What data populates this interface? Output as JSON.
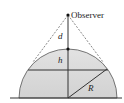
{
  "diagram": {
    "labels": {
      "observer": "Observer",
      "d": "d",
      "h": "h",
      "R": "R"
    },
    "colors": {
      "dome_fill": "#d9d9d9",
      "stroke": "#333333",
      "dashed": "#555555",
      "background": "#ffffff"
    }
  }
}
